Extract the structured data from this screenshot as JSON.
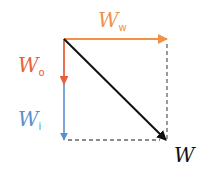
{
  "diagram": {
    "type": "vector-decomposition",
    "origin": {
      "x": 64,
      "y": 39
    },
    "vectors": [
      {
        "id": "ww",
        "symbol": "W",
        "subscript": "w",
        "color": "#f0914a",
        "from": [
          64,
          39
        ],
        "to": [
          167,
          39
        ],
        "label_pos": [
          98,
          25
        ]
      },
      {
        "id": "wo",
        "symbol": "W",
        "subscript": "o",
        "color": "#e8603a",
        "from": [
          64,
          39
        ],
        "to": [
          64,
          84
        ],
        "label_pos": [
          18,
          70
        ]
      },
      {
        "id": "wi",
        "symbol": "W",
        "subscript": "i",
        "color": "#5a8fd0",
        "from": [
          64,
          84
        ],
        "to": [
          64,
          140
        ],
        "label_pos": [
          18,
          124
        ]
      },
      {
        "id": "w",
        "symbol": "W",
        "subscript": "",
        "color": "#111111",
        "from": [
          64,
          39
        ],
        "to": [
          166,
          140
        ],
        "label_pos": [
          176,
          160
        ]
      }
    ],
    "dashed_lines": [
      {
        "from": [
          167,
          39
        ],
        "to": [
          167,
          140
        ],
        "color": "#666666"
      },
      {
        "from": [
          64,
          140
        ],
        "to": [
          167,
          140
        ],
        "color": "#666666"
      }
    ]
  }
}
